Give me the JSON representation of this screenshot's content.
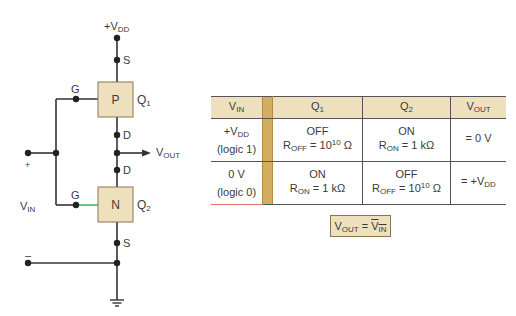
{
  "figure": {
    "type": "CMOS inverter schematic with truth table",
    "colors": {
      "wire": "#333333",
      "transistor_fill": "#efe0bd",
      "transistor_border": "#8a7650",
      "gate_wire_n": "#3fbf5a",
      "table_header_bg": "#efe0bd",
      "table_bar": "#d3ae61"
    }
  },
  "circuit": {
    "supply": {
      "prefix": "+V",
      "sub": "DD"
    },
    "q1": {
      "type_label": "P",
      "name": "Q",
      "sub": "1",
      "gate": "G",
      "source": "S",
      "drain": "D"
    },
    "q2": {
      "type_label": "N",
      "name": "Q",
      "sub": "2",
      "gate": "G",
      "source": "S",
      "drain": "D"
    },
    "output": {
      "main": "V",
      "sub": "OUT"
    },
    "input": {
      "main": "V",
      "sub": "IN",
      "plus": "+",
      "minus": "–"
    }
  },
  "table": {
    "headers": [
      {
        "main": "V",
        "sub": "IN"
      },
      {
        "main": "Q",
        "sub": "1"
      },
      {
        "main": "Q",
        "sub": "2"
      },
      {
        "main": "V",
        "sub": "OUT"
      }
    ],
    "rows": [
      {
        "vin_line1_main": "+V",
        "vin_line1_sub": "DD",
        "vin_line2": "(logic 1)",
        "q1_state": "OFF",
        "q1_r_main": "R",
        "q1_r_sub": "OFF",
        "q1_r_eq": " = 10",
        "q1_r_sup": "10",
        "q1_r_unit": " Ω",
        "q2_state": "ON",
        "q2_r_main": "R",
        "q2_r_sub": "ON",
        "q2_r_eq": " = 1 kΩ",
        "q2_r_sup": "",
        "q2_r_unit": "",
        "vout_main": "= 0 V",
        "vout_sub": ""
      },
      {
        "vin_line1_main": "0 V",
        "vin_line1_sub": "",
        "vin_line2": "(logic 0)",
        "q1_state": "ON",
        "q1_r_main": "R",
        "q1_r_sub": "ON",
        "q1_r_eq": " = 1 kΩ",
        "q1_r_sup": "",
        "q1_r_unit": "",
        "q2_state": "OFF",
        "q2_r_main": "R",
        "q2_r_sub": "OFF",
        "q2_r_eq": " = 10",
        "q2_r_sup": "10",
        "q2_r_unit": " Ω",
        "vout_main": "= +V",
        "vout_sub": "DD"
      }
    ]
  },
  "formula": {
    "lhs_main": "V",
    "lhs_sub": "OUT",
    "eq": " = ",
    "rhs_main": "V",
    "rhs_sub": "IN"
  }
}
